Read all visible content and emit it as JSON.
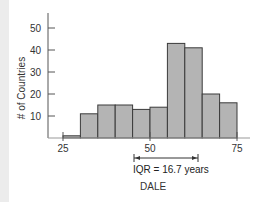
{
  "chart_data": {
    "type": "bar",
    "title": "",
    "xlabel": "DALE",
    "ylabel": "# of Countries",
    "bins": [
      [
        25,
        30
      ],
      [
        30,
        35
      ],
      [
        35,
        40
      ],
      [
        40,
        45
      ],
      [
        45,
        50
      ],
      [
        50,
        55
      ],
      [
        55,
        60
      ],
      [
        60,
        65
      ],
      [
        65,
        70
      ],
      [
        70,
        75
      ]
    ],
    "categories": [
      "25-30",
      "30-35",
      "35-40",
      "40-45",
      "45-50",
      "50-55",
      "55-60",
      "60-65",
      "65-70",
      "70-75"
    ],
    "values": [
      1,
      11,
      15,
      15,
      13,
      14,
      43,
      41,
      20,
      16
    ],
    "xlim": [
      25,
      75
    ],
    "ylim": [
      0,
      55
    ],
    "x_ticks": [
      25,
      50,
      75
    ],
    "y_ticks": [
      10,
      20,
      30,
      40,
      50
    ],
    "grid": false,
    "legend": null,
    "annotations": [
      {
        "text": "IQR = 16.7 years",
        "type": "double-arrow",
        "x_start": 45.5,
        "x_end": 64
      }
    ],
    "colors": {
      "bar_fill": "#b4b4b4",
      "bar_stroke": "#3a3a3a",
      "axis": "#555555"
    }
  },
  "labels": {
    "y_axis": "# of Countries",
    "x_axis": "DALE",
    "iqr": "IQR = 16.7 years",
    "x_tick_25": "25",
    "x_tick_50": "50",
    "x_tick_75": "75",
    "y_tick_10": "10",
    "y_tick_20": "20",
    "y_tick_30": "30",
    "y_tick_40": "40",
    "y_tick_50": "50"
  }
}
